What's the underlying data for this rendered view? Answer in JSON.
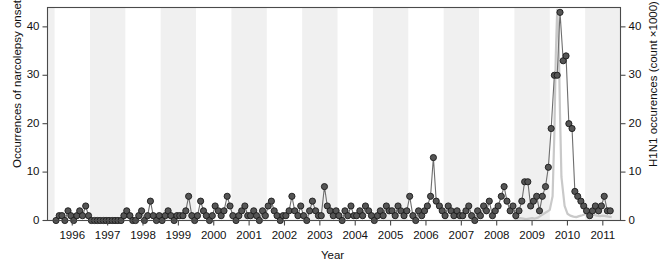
{
  "chart_data": {
    "type": "line",
    "title": "",
    "xlabel": "Year",
    "ylabel": "Occurrences of narcolepsy onset",
    "ylabel_right": "H1N1 occurences (count ×1000)",
    "xlim": [
      1995.3,
      2011.5
    ],
    "ylim": [
      0,
      44
    ],
    "ylim_right": [
      0,
      44
    ],
    "grid": false,
    "legend": "none",
    "xticks": [
      1996,
      1997,
      1998,
      1999,
      2000,
      2001,
      2002,
      2003,
      2004,
      2005,
      2006,
      2007,
      2008,
      2009,
      2010,
      2011
    ],
    "xticklabels": [
      "1996",
      "1997",
      "1998",
      "1999",
      "2000",
      "2001",
      "2002",
      "2003",
      "2004",
      "2005",
      "2006",
      "2007",
      "2008",
      "2009",
      "2010",
      "2011"
    ],
    "yticks_left": [
      0,
      10,
      20,
      30,
      40
    ],
    "yticklabels_left": [
      "0",
      "10",
      "20",
      "30",
      "40"
    ],
    "yticks_right": [
      0,
      10,
      20,
      30,
      40
    ],
    "yticklabels_right": [
      "0",
      "10",
      "20",
      "30",
      "40"
    ],
    "background_bands": "alternating light grey vertical year bands",
    "series": [
      {
        "name": "Occurrences of narcolepsy onset",
        "axis": "left",
        "marker": "filled-circle",
        "marker_color": "#555555",
        "line_color": "#6e6e6e",
        "x": [
          1995.54,
          1995.63,
          1995.71,
          1995.79,
          1995.88,
          1995.96,
          1996.04,
          1996.13,
          1996.21,
          1996.29,
          1996.38,
          1996.46,
          1996.54,
          1996.63,
          1996.71,
          1996.79,
          1996.88,
          1996.96,
          1997.04,
          1997.13,
          1997.21,
          1997.29,
          1997.38,
          1997.46,
          1997.54,
          1997.63,
          1997.71,
          1997.79,
          1997.88,
          1997.96,
          1998.04,
          1998.13,
          1998.21,
          1998.29,
          1998.38,
          1998.46,
          1998.54,
          1998.63,
          1998.71,
          1998.79,
          1998.88,
          1998.96,
          1999.04,
          1999.13,
          1999.21,
          1999.29,
          1999.38,
          1999.46,
          1999.54,
          1999.63,
          1999.71,
          1999.79,
          1999.88,
          1999.96,
          2000.04,
          2000.13,
          2000.21,
          2000.29,
          2000.38,
          2000.46,
          2000.54,
          2000.63,
          2000.71,
          2000.79,
          2000.88,
          2000.96,
          2001.04,
          2001.13,
          2001.21,
          2001.29,
          2001.38,
          2001.46,
          2001.54,
          2001.63,
          2001.71,
          2001.79,
          2001.88,
          2001.96,
          2002.04,
          2002.13,
          2002.21,
          2002.29,
          2002.38,
          2002.46,
          2002.54,
          2002.63,
          2002.71,
          2002.79,
          2002.88,
          2002.96,
          2003.04,
          2003.13,
          2003.21,
          2003.29,
          2003.38,
          2003.46,
          2003.54,
          2003.63,
          2003.71,
          2003.79,
          2003.88,
          2003.96,
          2004.04,
          2004.13,
          2004.21,
          2004.29,
          2004.38,
          2004.46,
          2004.54,
          2004.63,
          2004.71,
          2004.79,
          2004.88,
          2004.96,
          2005.04,
          2005.13,
          2005.21,
          2005.29,
          2005.38,
          2005.46,
          2005.54,
          2005.63,
          2005.71,
          2005.79,
          2005.88,
          2005.96,
          2006.04,
          2006.13,
          2006.21,
          2006.29,
          2006.38,
          2006.46,
          2006.54,
          2006.63,
          2006.71,
          2006.79,
          2006.88,
          2006.96,
          2007.04,
          2007.13,
          2007.21,
          2007.29,
          2007.38,
          2007.46,
          2007.54,
          2007.63,
          2007.71,
          2007.79,
          2007.88,
          2007.96,
          2008.04,
          2008.13,
          2008.21,
          2008.29,
          2008.38,
          2008.46,
          2008.54,
          2008.63,
          2008.71,
          2008.79,
          2008.88,
          2008.96,
          2009.04,
          2009.13,
          2009.21,
          2009.29,
          2009.38,
          2009.46,
          2009.54,
          2009.63,
          2009.71,
          2009.79,
          2009.88,
          2009.96,
          2010.04,
          2010.13,
          2010.21,
          2010.29,
          2010.38,
          2010.46,
          2010.54,
          2010.63,
          2010.71,
          2010.79,
          2010.88,
          2010.96,
          2011.04,
          2011.13,
          2011.21
        ],
        "y": [
          0,
          1,
          1,
          0,
          2,
          1,
          0,
          1,
          2,
          1,
          3,
          1,
          0,
          0,
          0,
          0,
          0,
          0,
          0,
          0,
          0,
          0,
          0,
          1,
          2,
          1,
          0,
          0,
          1,
          2,
          0,
          1,
          4,
          1,
          0,
          1,
          0,
          1,
          2,
          1,
          0,
          1,
          1,
          1,
          2,
          5,
          1,
          0,
          1,
          4,
          2,
          1,
          0,
          1,
          3,
          2,
          1,
          2,
          5,
          3,
          1,
          0,
          1,
          2,
          3,
          1,
          1,
          2,
          1,
          0,
          2,
          1,
          3,
          4,
          2,
          1,
          0,
          1,
          1,
          2,
          5,
          2,
          1,
          3,
          1,
          0,
          2,
          4,
          2,
          1,
          1,
          7,
          3,
          2,
          1,
          2,
          1,
          0,
          2,
          1,
          3,
          1,
          1,
          2,
          1,
          3,
          2,
          1,
          0,
          1,
          2,
          1,
          3,
          2,
          2,
          1,
          3,
          2,
          1,
          2,
          5,
          1,
          0,
          2,
          1,
          2,
          3,
          5,
          13,
          4,
          3,
          2,
          1,
          3,
          2,
          1,
          2,
          1,
          1,
          2,
          3,
          1,
          0,
          2,
          1,
          3,
          2,
          4,
          1,
          2,
          3,
          5,
          7,
          4,
          2,
          3,
          1,
          2,
          4,
          8,
          8,
          3,
          4,
          5,
          2,
          5,
          7,
          11,
          19,
          30,
          30,
          43,
          33,
          34,
          20,
          19,
          6,
          5,
          4,
          3,
          2,
          1,
          2,
          3,
          2,
          3,
          5,
          2,
          2
        ]
      },
      {
        "name": "H1N1 occurences (count ×1000)",
        "axis": "right",
        "marker": "none",
        "line_color": "#c9c9c9",
        "x": [
          2008.5,
          2008.58,
          2008.67,
          2008.75,
          2008.83,
          2008.92,
          2009.0,
          2009.08,
          2009.17,
          2009.25,
          2009.33,
          2009.42,
          2009.5,
          2009.58,
          2009.63,
          2009.67,
          2009.71,
          2009.75,
          2009.79,
          2009.83,
          2009.92,
          2010.0,
          2010.08,
          2010.17,
          2010.25,
          2010.33,
          2010.42,
          2010.5,
          2010.58,
          2010.67,
          2010.75,
          2010.83,
          2010.92,
          2011.0,
          2011.08,
          2011.17,
          2011.25
        ],
        "y": [
          0.3,
          0.4,
          0.5,
          0.4,
          0.3,
          0.4,
          0.5,
          0.4,
          0.6,
          1.0,
          1.4,
          1.8,
          2.2,
          5.0,
          18.0,
          34.0,
          43.5,
          38.0,
          22.0,
          9.0,
          3.0,
          1.4,
          1.0,
          0.8,
          0.7,
          0.9,
          1.1,
          1.3,
          1.6,
          1.4,
          1.2,
          1.0,
          0.9,
          1.0,
          0.9,
          0.8,
          0.7
        ]
      }
    ]
  }
}
